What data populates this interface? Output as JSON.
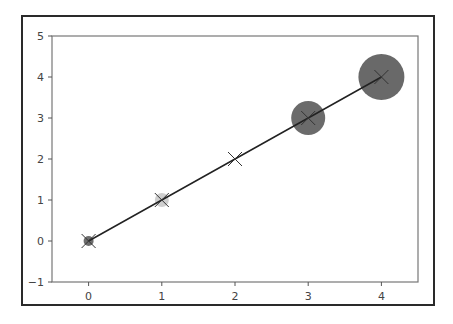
{
  "chart_data": {
    "type": "scatter",
    "title": "",
    "xlabel": "",
    "ylabel": "",
    "xlim": [
      -0.5,
      4.5
    ],
    "ylim": [
      -1,
      5
    ],
    "grid": false,
    "legend": null,
    "x_ticks": [
      "0",
      "1",
      "2",
      "3",
      "4"
    ],
    "y_ticks": [
      "−1",
      "0",
      "1",
      "2",
      "3",
      "4",
      "5"
    ],
    "x_tick_values": [
      0,
      1,
      2,
      3,
      4
    ],
    "y_tick_values": [
      -1,
      0,
      1,
      2,
      3,
      4,
      5
    ],
    "series": [
      {
        "name": "line",
        "kind": "line",
        "marker": "x",
        "color": "#222222",
        "x": [
          0,
          1,
          2,
          3,
          4
        ],
        "y": [
          0,
          1,
          2,
          3,
          4
        ]
      },
      {
        "name": "bubbles",
        "kind": "scatter",
        "x": [
          0,
          1,
          2,
          3,
          4
        ],
        "y": [
          0,
          1,
          2,
          3,
          4
        ],
        "radius_px": [
          5,
          7,
          10,
          17,
          23
        ],
        "colors": [
          "#6e6e6e",
          "#cfcfcf",
          "#ffffff",
          "#6b6b6b",
          "#696969"
        ]
      }
    ]
  }
}
